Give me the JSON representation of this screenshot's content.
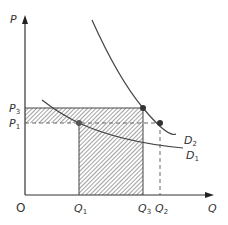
{
  "diagram": {
    "type": "economics-demand-shift",
    "axes": {
      "y_label": "P",
      "x_label": "Q",
      "origin_label": "O"
    },
    "price_levels": [
      {
        "id": "P3",
        "base": "P",
        "sub": "3"
      },
      {
        "id": "P1",
        "base": "P",
        "sub": "1"
      }
    ],
    "quantity_levels": [
      {
        "id": "Q1",
        "base": "Q",
        "sub": "1"
      },
      {
        "id": "Q3",
        "base": "Q",
        "sub": "3"
      },
      {
        "id": "Q2",
        "base": "Q",
        "sub": "2"
      }
    ],
    "curves": [
      {
        "id": "D2",
        "base": "D",
        "sub": "2"
      },
      {
        "id": "D1",
        "base": "D",
        "sub": "1"
      }
    ],
    "colors": {
      "line": "#333333",
      "hatch": "#555555",
      "dash": "#666666",
      "background": "#ffffff"
    }
  }
}
